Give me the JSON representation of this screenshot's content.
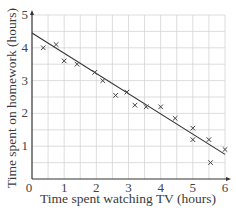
{
  "chart_data": {
    "type": "scatter",
    "title": "",
    "xlabel": "Time spent watching TV (hours)",
    "ylabel": "Time spent on homework (hours)",
    "xlim": [
      0,
      6
    ],
    "ylim": [
      0,
      5
    ],
    "x_ticks": [
      0,
      1,
      2,
      3,
      4,
      5,
      6
    ],
    "y_ticks": [
      1,
      2,
      3,
      4,
      5
    ],
    "grid": true,
    "grid_step": 0.5,
    "legend": null,
    "series": [
      {
        "name": "observations",
        "marker": "x",
        "points": [
          {
            "x": 0.35,
            "y": 4.0
          },
          {
            "x": 0.75,
            "y": 4.1
          },
          {
            "x": 1.0,
            "y": 3.6
          },
          {
            "x": 1.4,
            "y": 3.5
          },
          {
            "x": 1.95,
            "y": 3.25
          },
          {
            "x": 2.2,
            "y": 3.0
          },
          {
            "x": 2.6,
            "y": 2.55
          },
          {
            "x": 2.95,
            "y": 2.65
          },
          {
            "x": 3.2,
            "y": 2.25
          },
          {
            "x": 3.55,
            "y": 2.2
          },
          {
            "x": 4.0,
            "y": 2.2
          },
          {
            "x": 4.45,
            "y": 1.85
          },
          {
            "x": 5.0,
            "y": 1.55
          },
          {
            "x": 5.0,
            "y": 1.2
          },
          {
            "x": 5.5,
            "y": 1.2
          },
          {
            "x": 5.55,
            "y": 0.5
          },
          {
            "x": 6.0,
            "y": 0.9
          }
        ]
      }
    ],
    "line_of_best_fit": {
      "start": {
        "x": 0,
        "y": 4.45
      },
      "end": {
        "x": 6,
        "y": 0.75
      }
    }
  },
  "colors": {
    "grid": "#d4d4d4",
    "axis": "#333333",
    "marker": "#444444",
    "fit_line": "#333333"
  }
}
